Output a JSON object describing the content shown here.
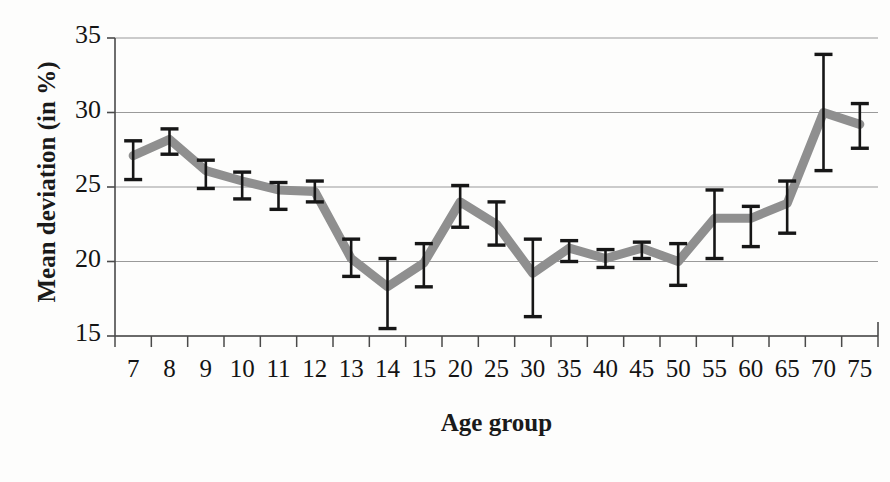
{
  "chart_data": {
    "type": "line",
    "title": "",
    "xlabel": "Age group",
    "ylabel": "Mean deviation (in %)",
    "categories": [
      "7",
      "8",
      "9",
      "10",
      "11",
      "12",
      "13",
      "14",
      "15",
      "20",
      "25",
      "30",
      "35",
      "40",
      "45",
      "50",
      "55",
      "60",
      "65",
      "70",
      "75"
    ],
    "values": [
      27.1,
      28.2,
      26.1,
      25.4,
      24.8,
      24.7,
      20.2,
      18.3,
      19.9,
      24.0,
      22.5,
      19.2,
      20.9,
      20.2,
      20.9,
      20.0,
      22.9,
      22.9,
      23.9,
      30.0,
      29.2
    ],
    "error_upper": [
      28.1,
      28.9,
      26.8,
      26.0,
      25.3,
      25.4,
      21.5,
      20.2,
      21.2,
      25.1,
      24.0,
      21.5,
      21.4,
      20.8,
      21.3,
      21.2,
      24.8,
      23.7,
      25.4,
      33.9,
      30.6
    ],
    "error_lower": [
      25.5,
      27.2,
      24.9,
      24.2,
      23.5,
      24.0,
      19.0,
      15.5,
      18.3,
      22.3,
      21.1,
      16.3,
      20.0,
      19.6,
      20.2,
      18.4,
      20.2,
      21.0,
      21.9,
      26.1,
      27.6
    ],
    "yticks": [
      15,
      20,
      25,
      30,
      35
    ],
    "ylim": [
      15,
      35
    ],
    "grid": true,
    "legend": "none",
    "series_color": "#8f8f8f",
    "errorbar_color": "#161616",
    "axis_color": "#4a4a4a",
    "grid_color": "#9a9a9a"
  }
}
